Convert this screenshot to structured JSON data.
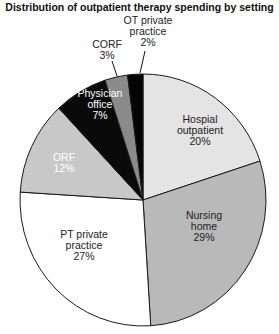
{
  "chart_data": {
    "type": "pie",
    "title": "Distribution of outpatient therapy spending by setting",
    "start_angle_deg": 0,
    "direction": "clockwise",
    "unit": "%",
    "slices": [
      {
        "label": "Hospial outpatient",
        "lines": [
          "Hospial",
          "outpatient",
          "20%"
        ],
        "value": 20,
        "color": "#e4e4e4",
        "text_color": "#222222"
      },
      {
        "label": "Nursing home",
        "lines": [
          "Nursing",
          "home",
          "29%"
        ],
        "value": 29,
        "color": "#b9b9b9",
        "text_color": "#222222"
      },
      {
        "label": "PT private practice",
        "lines": [
          "PT private",
          "practice",
          "27%"
        ],
        "value": 27,
        "color": "#ffffff",
        "text_color": "#222222"
      },
      {
        "label": "ORF",
        "lines": [
          "ORF",
          "12%"
        ],
        "value": 12,
        "color": "#c8c8c8",
        "text_color": "#ffffff"
      },
      {
        "label": "Physician office",
        "lines": [
          "Physician",
          "office",
          "7%"
        ],
        "value": 7,
        "color": "#0a0a0a",
        "text_color": "#ffffff"
      },
      {
        "label": "CORF",
        "lines": [
          "CORF",
          "3%"
        ],
        "value": 3,
        "color": "#8a8a8a",
        "text_color": "#222222"
      },
      {
        "label": "OT private practice",
        "lines": [
          "OT private",
          "practice",
          "2%"
        ],
        "value": 2,
        "color": "#050505",
        "text_color": "#222222"
      }
    ]
  }
}
